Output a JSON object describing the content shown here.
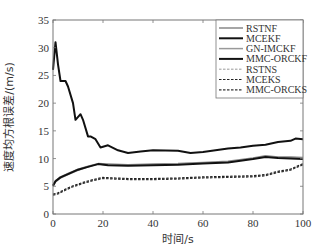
{
  "chart_data": {
    "type": "line",
    "title": "",
    "xlabel": "时间/s",
    "ylabel": "速度均方根误差/(m/s)",
    "xlim": [
      0,
      100
    ],
    "ylim": [
      0,
      35
    ],
    "xticks": [
      0,
      20,
      40,
      60,
      80,
      100
    ],
    "yticks": [
      0,
      5,
      10,
      15,
      20,
      25,
      30,
      35
    ],
    "grid": false,
    "legend_position": "upper right",
    "series": [
      {
        "name": "RSTNF",
        "style": "solid",
        "color": "#888888",
        "width": 1.5,
        "x": [
          0,
          1,
          3,
          6,
          10,
          14,
          18,
          22,
          30,
          40,
          50,
          60,
          70,
          80,
          85,
          90,
          95,
          100
        ],
        "y": [
          5.2,
          6,
          6.7,
          7.3,
          8.1,
          8.6,
          9.1,
          9.0,
          8.9,
          9.0,
          9.1,
          9.3,
          9.5,
          10.1,
          10.5,
          10.3,
          10.3,
          10.2
        ]
      },
      {
        "name": "MCEKF",
        "style": "solid",
        "color": "#111111",
        "width": 2,
        "x": [
          0,
          1,
          2,
          3,
          5,
          6,
          8,
          9,
          11,
          12,
          14,
          15,
          17,
          19,
          22,
          26,
          30,
          35,
          40,
          50,
          55,
          60,
          65,
          70,
          75,
          80,
          85,
          90,
          95,
          97,
          100
        ],
        "y": [
          26,
          31,
          27,
          24,
          24,
          23,
          20,
          17,
          18,
          17,
          14,
          14,
          13.5,
          12,
          12.4,
          11.5,
          11,
          11.3,
          11.5,
          11.4,
          11,
          11.2,
          11.5,
          11.8,
          12,
          12.3,
          12.5,
          13,
          13.2,
          13.6,
          13.5
        ]
      },
      {
        "name": "GN-IMCKF",
        "style": "solid",
        "color": "#999999",
        "width": 1.5,
        "x": [
          0,
          1,
          3,
          6,
          10,
          14,
          18,
          22,
          30,
          40,
          50,
          60,
          70,
          80,
          85,
          90,
          95,
          100
        ],
        "y": [
          5.0,
          5.8,
          6.5,
          7.1,
          7.9,
          8.5,
          9.0,
          8.9,
          8.8,
          8.9,
          9.0,
          9.2,
          9.4,
          10.0,
          10.4,
          10.2,
          10.2,
          10.1
        ]
      },
      {
        "name": "MMC-ORCKF",
        "style": "solid",
        "color": "#111111",
        "width": 2,
        "x": [
          0,
          1,
          3,
          6,
          10,
          14,
          18,
          22,
          30,
          40,
          50,
          60,
          70,
          80,
          85,
          90,
          95,
          100
        ],
        "y": [
          5.1,
          5.9,
          6.6,
          7.2,
          8.0,
          8.5,
          9.0,
          8.8,
          8.7,
          8.8,
          8.9,
          9.1,
          9.3,
          9.9,
          10.3,
          10.1,
          10.0,
          9.9
        ]
      },
      {
        "name": "RSTNS",
        "style": "dashed",
        "color": "#999999",
        "width": 1,
        "x": [
          0,
          2,
          5,
          8,
          12,
          16,
          20,
          25,
          30,
          40,
          50,
          55,
          60,
          70,
          80,
          85,
          90,
          95,
          100
        ],
        "y": [
          3.5,
          3.7,
          4.4,
          5.0,
          5.6,
          6.1,
          6.5,
          6.4,
          6.3,
          6.3,
          6.4,
          6.5,
          6.6,
          6.7,
          6.8,
          7.0,
          7.6,
          8.0,
          9.0
        ]
      },
      {
        "name": "MCEKS",
        "style": "dashed",
        "color": "#222222",
        "width": 1.2,
        "x": [
          0,
          2,
          5,
          8,
          12,
          16,
          20,
          25,
          30,
          40,
          50,
          55,
          60,
          70,
          80,
          85,
          90,
          95,
          100
        ],
        "y": [
          3.6,
          3.8,
          4.5,
          5.1,
          5.7,
          6.2,
          6.6,
          6.5,
          6.4,
          6.4,
          6.5,
          6.6,
          6.7,
          6.8,
          6.9,
          7.1,
          7.7,
          8.1,
          9.1
        ]
      },
      {
        "name": "MMC-ORCKS",
        "style": "dashed",
        "color": "#333333",
        "width": 1.2,
        "x": [
          0,
          2,
          5,
          8,
          12,
          16,
          20,
          25,
          30,
          40,
          50,
          55,
          60,
          70,
          80,
          85,
          90,
          95,
          100
        ],
        "y": [
          3.4,
          3.6,
          4.3,
          4.9,
          5.5,
          6.0,
          6.4,
          6.3,
          6.2,
          6.2,
          6.3,
          6.4,
          6.5,
          6.6,
          6.7,
          6.9,
          7.5,
          7.9,
          8.9
        ]
      }
    ]
  }
}
